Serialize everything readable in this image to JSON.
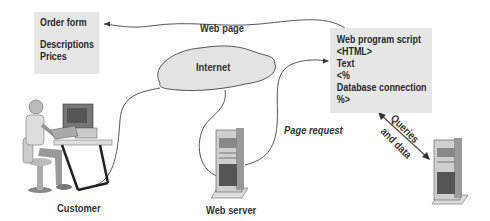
{
  "order_box": {
    "line1": "Order form",
    "line2": "Descriptions",
    "line3": "Prices"
  },
  "script_box": {
    "lines": [
      "Web program script",
      "<HTML>",
      "Text",
      "<%",
      "Database connection",
      "%>"
    ]
  },
  "labels": {
    "web_page": "Web page",
    "internet": "Internet",
    "page_request": "Page request",
    "queries": "Queries",
    "and_data": "and data",
    "customer": "Customer",
    "web_server": "Web server"
  }
}
